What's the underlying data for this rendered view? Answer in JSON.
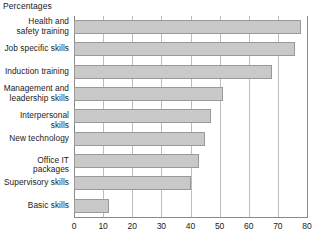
{
  "chart_data": {
    "type": "bar",
    "orientation": "horizontal",
    "title": "",
    "subtitle": "Percentages",
    "xlabel": "",
    "ylabel": "",
    "xlim": [
      0,
      80
    ],
    "xticks": [
      0,
      10,
      20,
      30,
      40,
      50,
      60,
      70,
      80
    ],
    "grid": true,
    "legend": false,
    "bar_color": "#c9c9c9",
    "bar_border_color": "#9a9a9a",
    "gridline_color": "#bdbdbd",
    "axis_color": "#8a8a8a",
    "categories": [
      "Health and safety training",
      "Job specific skills",
      "Induction training",
      "Management and leadership skills",
      "Interpersonal skills",
      "New technology",
      "Office IT packages",
      "Supervisory skills",
      "Basic skills"
    ],
    "category_lines": [
      [
        "Health and",
        "safety training"
      ],
      [
        "Job specific skills"
      ],
      [
        "Induction training"
      ],
      [
        "Management and",
        "leadership skills"
      ],
      [
        "Interpersonal skills"
      ],
      [
        "New technology"
      ],
      [
        "Office IT packages"
      ],
      [
        "Supervisory skills"
      ],
      [
        "Basic skills"
      ]
    ],
    "values": [
      78,
      76,
      68,
      51,
      47,
      45,
      43,
      40,
      12
    ]
  }
}
